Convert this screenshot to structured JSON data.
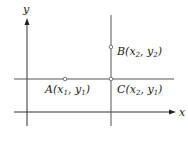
{
  "diagram": {
    "axes": {
      "x_label": "x",
      "y_label": "y"
    },
    "points": [
      {
        "id": "A",
        "label": "A",
        "x_sym": "x",
        "x_sub": "1",
        "y_sym": "y",
        "y_sub": "1"
      },
      {
        "id": "B",
        "label": "B",
        "x_sym": "x",
        "x_sub": "2",
        "y_sym": "y",
        "y_sub": "2"
      },
      {
        "id": "C",
        "label": "C",
        "x_sym": "x",
        "x_sub": "2",
        "y_sym": "y",
        "y_sub": "1"
      }
    ],
    "colors": {
      "axis": "#333333",
      "guide_line": "#555555",
      "point": "#777777",
      "text": "#222222"
    }
  }
}
